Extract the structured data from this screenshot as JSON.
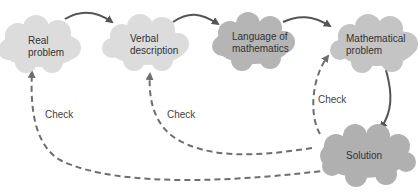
{
  "diagram": {
    "nodes": [
      {
        "id": "real-problem",
        "line1": "Real",
        "line2": "problem"
      },
      {
        "id": "verbal-description",
        "line1": "Verbal",
        "line2": "description"
      },
      {
        "id": "language-of-mathematics",
        "line1": "Language of",
        "line2": "mathematics"
      },
      {
        "id": "mathematical-problem",
        "line1": "Mathematical",
        "line2": "problem"
      },
      {
        "id": "solution",
        "line1": "Solution"
      }
    ],
    "edges": [
      {
        "from": "real-problem",
        "to": "verbal-description",
        "style": "solid"
      },
      {
        "from": "verbal-description",
        "to": "language-of-mathematics",
        "style": "solid"
      },
      {
        "from": "language-of-mathematics",
        "to": "mathematical-problem",
        "style": "solid"
      },
      {
        "from": "mathematical-problem",
        "to": "solution",
        "style": "solid"
      },
      {
        "from": "solution",
        "to": "mathematical-problem",
        "style": "dashed",
        "label": "Check"
      },
      {
        "from": "solution",
        "to": "verbal-description",
        "style": "dashed",
        "label": "Check"
      },
      {
        "from": "solution",
        "to": "real-problem",
        "style": "dashed",
        "label": "Check"
      }
    ],
    "colors": {
      "cloud_light": "#dcdcdc",
      "cloud_dark": "#b5b5b5",
      "arrow": "#555555",
      "dashed": "#6e6e6e"
    }
  }
}
